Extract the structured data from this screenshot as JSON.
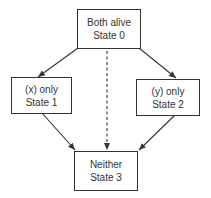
{
  "diagram": {
    "type": "state-transition",
    "colors": {
      "stroke": "#333333",
      "text": "#333333",
      "background": "#ffffff"
    },
    "nodes": [
      {
        "id": "state0",
        "line1": "Both alive",
        "line2": "State 0"
      },
      {
        "id": "state1",
        "line1": "(x) only",
        "line2": "State 1"
      },
      {
        "id": "state2",
        "line1": "(y) only",
        "line2": "State 2"
      },
      {
        "id": "state3",
        "line1": "Neither",
        "line2": "State 3"
      }
    ],
    "edges": [
      {
        "from": "state0",
        "to": "state1",
        "style": "solid"
      },
      {
        "from": "state0",
        "to": "state2",
        "style": "solid"
      },
      {
        "from": "state0",
        "to": "state3",
        "style": "dashed"
      },
      {
        "from": "state1",
        "to": "state3",
        "style": "solid"
      },
      {
        "from": "state2",
        "to": "state3",
        "style": "solid"
      }
    ]
  }
}
